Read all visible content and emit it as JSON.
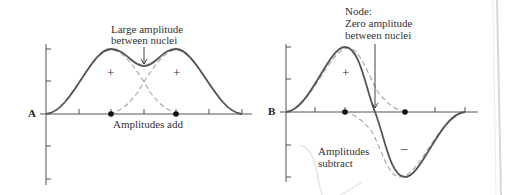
{
  "panel_a": {
    "letter": "A",
    "annotation_top_line1": "Large amplitude",
    "annotation_top_line2": "between nuclei",
    "annotation_bottom": "Amplitudes add",
    "sign_left": "+",
    "sign_right": "+"
  },
  "panel_b": {
    "letter": "B",
    "annotation_top_line1": "Node:",
    "annotation_top_line2": "Zero amplitude",
    "annotation_top_line3": "between nuclei",
    "annotation_bottom_line1": "Amplitudes",
    "annotation_bottom_line2": "subtract",
    "sign_plus": "+",
    "sign_minus": "–"
  },
  "colors": {
    "solid_curve": "#555555",
    "dashed_curve": "#aaaaaa",
    "axis": "#555555",
    "nucleus": "#111111"
  }
}
